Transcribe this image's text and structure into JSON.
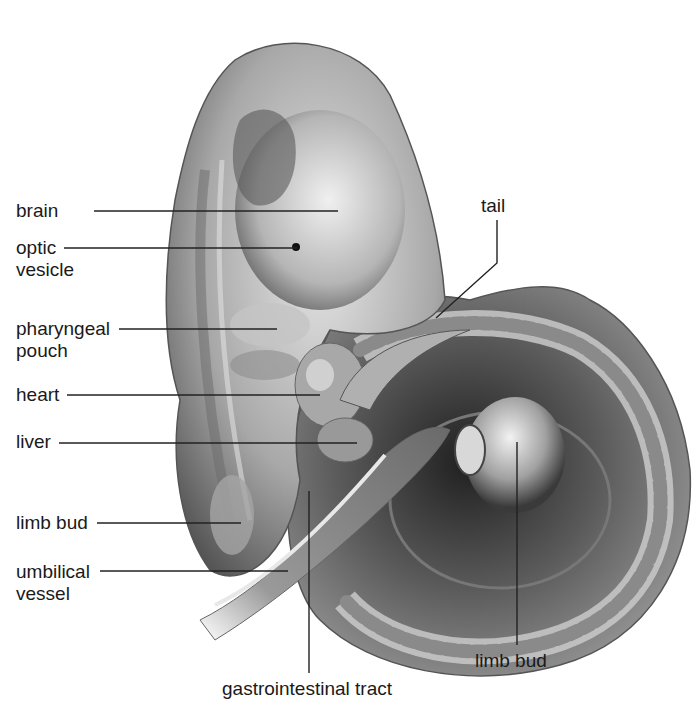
{
  "diagram": {
    "labels": [
      {
        "id": "brain",
        "text": "brain",
        "x": 16,
        "y": 200,
        "line": [
          [
            94,
            211
          ],
          [
            338,
            211
          ]
        ]
      },
      {
        "id": "optic-vesicle",
        "text": "optic\nvesicle",
        "x": 16,
        "y": 237,
        "line": [
          [
            64,
            248
          ],
          [
            297,
            248
          ]
        ]
      },
      {
        "id": "pharyngeal-pouch",
        "text": "pharyngeal\npouch",
        "x": 16,
        "y": 318,
        "line": [
          [
            119,
            329
          ],
          [
            277,
            329
          ]
        ]
      },
      {
        "id": "heart",
        "text": "heart",
        "x": 16,
        "y": 384,
        "line": [
          [
            67,
            395
          ],
          [
            320,
            395
          ]
        ]
      },
      {
        "id": "liver",
        "text": "liver",
        "x": 16,
        "y": 431,
        "line": [
          [
            59,
            443
          ],
          [
            357,
            443
          ]
        ]
      },
      {
        "id": "limb-bud-upper",
        "text": "limb bud",
        "x": 16,
        "y": 512,
        "line": [
          [
            97,
            523
          ],
          [
            241,
            523
          ]
        ]
      },
      {
        "id": "umbilical-vessel",
        "text": "umbilical\nvessel",
        "x": 16,
        "y": 561,
        "line": [
          [
            100,
            571
          ],
          [
            288,
            571
          ]
        ]
      },
      {
        "id": "gastrointestinal-tract",
        "text": "gastrointestinal tract",
        "x": 222,
        "y": 678,
        "line": [
          [
            309,
            491
          ],
          [
            309,
            673
          ]
        ]
      },
      {
        "id": "limb-bud-lower",
        "text": "limb bud",
        "x": 475,
        "y": 650,
        "line": [
          [
            517,
            442
          ],
          [
            517,
            645
          ]
        ]
      },
      {
        "id": "tail",
        "text": "tail",
        "x": 481,
        "y": 195,
        "line": [
          [
            497,
            220
          ],
          [
            497,
            263
          ],
          [
            436,
            318
          ]
        ]
      }
    ],
    "colors": {
      "text": "#1a1a1a",
      "leader_line": "#222222",
      "tissue_light": "#d8d8d8",
      "tissue_mid": "#9a9a9a",
      "tissue_dark": "#3c3c3c",
      "background": "#ffffff"
    }
  }
}
